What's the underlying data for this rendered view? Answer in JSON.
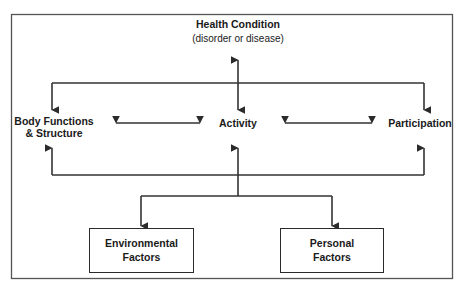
{
  "diagram": {
    "title_node": {
      "name": "health-condition",
      "title": "Health Condition",
      "subtitle": "(disorder or disease)"
    },
    "middle_row": {
      "body_functions": {
        "line1": "Body Functions",
        "line2": "& Structure"
      },
      "activity": {
        "label": "Activity"
      },
      "participation": {
        "label": "Participation"
      }
    },
    "bottom_row": {
      "environmental": {
        "line1": "Environmental",
        "line2": "Factors"
      },
      "personal": {
        "line1": "Personal",
        "line2": "Factors"
      }
    },
    "style": {
      "line_color": "#333333",
      "border_color": "#2b2b2b",
      "text_color": "#1a1a1a",
      "background": "#ffffff"
    }
  }
}
